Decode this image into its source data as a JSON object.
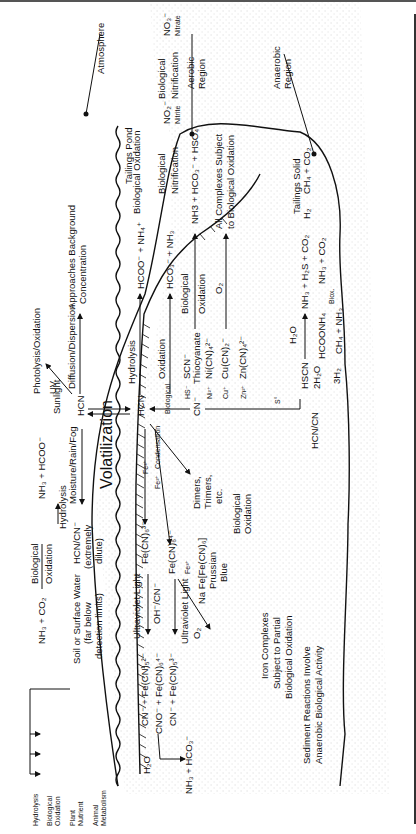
{
  "regions": {
    "atmosphere": "Atmosphere",
    "aerobic_1": "Aerobic",
    "aerobic_2": "Region",
    "anaerobic_1": "Anaerobic",
    "anaerobic_2": "Region",
    "tailings_pond": "Tailings Pond",
    "tailings_solid": "Tailings Solid"
  },
  "atmosphere_path": {
    "hcn": "HCN",
    "sunlight": "Sunlight",
    "uv": "UV",
    "photolysis": "Photolysis/Oxidation",
    "diffusion": "Diffusion/Dispersion",
    "approaches_1": "Approaches Background",
    "approaches_2": "Concentration",
    "volatilization": "Volatilization",
    "moisture": "Moisture/Rain/Fog"
  },
  "soil_path": {
    "hcn_cn": "HCN/CN⁻",
    "extremely_1": "(extremely",
    "extremely_2": "dilute)",
    "hydrolysis": "Hydrolysis",
    "nh3_hcoo": "NH₃ + HCOO⁻",
    "bio_ox_1": "Biological",
    "bio_ox_2": "Oxidation",
    "nh3_co2": "NH₃ + CO₂",
    "soil_water": "Soil or Surface Water",
    "far_below_1": "(far below",
    "far_below_2": "detection limits)",
    "fates": [
      "Hydrolysis",
      "Biological",
      "Oxidation",
      "Plant",
      "Nutrient",
      "Animal",
      "Metabolism"
    ]
  },
  "pond": {
    "hcn": "HCN",
    "hydrolysis": "Hydrolysis",
    "hcoo_nh4": "HCOO⁻ + NH₄⁺",
    "oxidation": "Oxidation",
    "hco3_nh3": "HCO₃⁻ + NH₃",
    "biological": "Biological",
    "bio_oxidation": "Biological Oxidation",
    "nitrification_bio": "Biological",
    "nitrification": "Nitrification",
    "no2": "NO₂⁻",
    "nitrite": "Nitrite",
    "no3": "NO₃⁻",
    "nitrate": "Nitrate",
    "cn": "CN⁻",
    "hs": "HS⁻",
    "scn": "SCN⁻",
    "thiocyanate": "Thiocyanate",
    "scn_bio_1": "Biological",
    "scn_bio_2": "Oxidation",
    "scn_products": "NH3 + HCO₃⁻ + HSO₄",
    "ni": "Ni²⁺",
    "ni_cn": "Ni(CN)₄²⁻",
    "cu": "Cu⁺",
    "cu_cn": "Cu(CN)₂⁻",
    "o2": "O₂",
    "zn": "Zn²⁺",
    "zn_cn": "Zn(CN)₄²⁻",
    "all_complexes_1": "All Complexes Subject",
    "all_complexes_2": "to Biological Oxidation",
    "condensation": "Condensation",
    "dimers_1": "Dimers,",
    "dimers_2": "Trimers,",
    "dimers_3": "etc.",
    "dimers_bio_1": "Biological",
    "dimers_bio_2": "Oxidation",
    "fe3": "Fe³⁺",
    "fe2": "Fe²⁺",
    "fe_cn6_3": "Fe(CN)₆³⁻",
    "fe_cn6_4": "Fe(CN)₆⁴⁻",
    "fe3_b": "Fe³⁺",
    "prussian_1": "Na Fe[Fe(CN)₆]",
    "prussian_2": "Prussian",
    "prussian_3": "Blue",
    "o2_b": "O₂",
    "uv_light_1": "Ultraviolet Light",
    "oh_cn": "OH⁻/CN⁻",
    "uv_light_2": "Ultraviolet Light",
    "cn_fecn5_a": "CN⁻ + Fe(CN)₅²⁻",
    "cno_fecn6": "CNO⁻ + Fe(CN)₆⁴⁻",
    "cn_fecn5_b": "CN⁻ + Fe(CN)₅³⁻",
    "h2o": "H₂O",
    "nh3_hco3": "NH₃ + HCO₃⁻",
    "iron_1": "Iron Complexes",
    "iron_2": "Subject to Partial",
    "iron_3": "Biological Oxidation"
  },
  "sediment": {
    "s0": "S°",
    "hcn_cn": "HCN/CN",
    "hscn": "HSCN",
    "h2o": "H₂O",
    "nh3_h2s_co2": "NH₃ + H₂S + CO₂",
    "h2": "H₂",
    "ch4_co2": "CH₄ + CO₂",
    "two_h2o": "2H₂O",
    "hcoonh4": "HCOONH₄",
    "biox": "Biox.",
    "nh3_co2": "NH₃ + CO₂",
    "three_h2": "3H₂",
    "ch4_nh3": "CH₄ + NH₃",
    "sediment_1": "Sediment Reactions Involve",
    "sediment_2": "Anaerobic Biological Activity"
  }
}
